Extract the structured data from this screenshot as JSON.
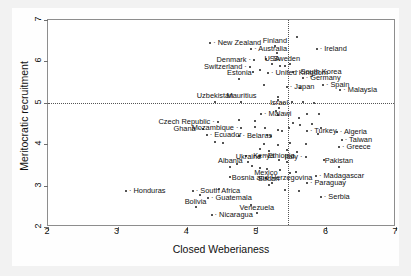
{
  "chart_data": {
    "type": "scatter",
    "title": "",
    "xlabel": "Closed Weberianess",
    "ylabel": "Meritocratic recruitment",
    "xlim": [
      2,
      7
    ],
    "ylim": [
      2,
      7
    ],
    "xticks": [
      2,
      3,
      4,
      5,
      6,
      7
    ],
    "yticks": [
      2,
      3,
      4,
      5,
      6,
      7
    ],
    "grid": false,
    "legend": null,
    "reference_lines": [
      {
        "orientation": "horizontal",
        "value": 5,
        "style": "dotted"
      },
      {
        "orientation": "vertical",
        "value": 5.45,
        "style": "dotted"
      }
    ],
    "points": [
      {
        "label": "New Zealand",
        "x": 4.33,
        "y": 6.44,
        "anchor": "left"
      },
      {
        "label": "Australia",
        "x": 4.92,
        "y": 6.3,
        "anchor": "left"
      },
      {
        "label": "Finland",
        "x": 5.26,
        "y": 6.36,
        "anchor": "center"
      },
      {
        "label": "Ireland",
        "x": 5.86,
        "y": 6.3,
        "anchor": "left"
      },
      {
        "label": "Denmark",
        "x": 4.96,
        "y": 6.03,
        "anchor": "right"
      },
      {
        "label": "Sweden",
        "x": 5.13,
        "y": 6.05,
        "anchor": "left"
      },
      {
        "label": "USA",
        "x": 5.22,
        "y": 5.93,
        "anchor": "center"
      },
      {
        "label": "Switzerland",
        "x": 4.9,
        "y": 5.86,
        "anchor": "right"
      },
      {
        "label": "United Kingdom",
        "x": 5.16,
        "y": 5.73,
        "anchor": "left"
      },
      {
        "label": "South Korea",
        "x": 5.52,
        "y": 5.74,
        "anchor": "left"
      },
      {
        "label": "Germany",
        "x": 5.66,
        "y": 5.6,
        "anchor": "left"
      },
      {
        "label": "Estonia",
        "x": 4.75,
        "y": 5.58,
        "anchor": "center"
      },
      {
        "label": "Japan",
        "x": 5.43,
        "y": 5.37,
        "anchor": "left"
      },
      {
        "label": "Spain",
        "x": 5.95,
        "y": 5.42,
        "anchor": "left"
      },
      {
        "label": "Malaysia",
        "x": 6.2,
        "y": 5.3,
        "anchor": "left"
      },
      {
        "label": "Uzbekistan",
        "x": 4.4,
        "y": 5.02,
        "anchor": "center"
      },
      {
        "label": "Mauritius",
        "x": 4.78,
        "y": 5.02,
        "anchor": "center"
      },
      {
        "label": "Israel",
        "x": 5.32,
        "y": 4.87,
        "anchor": "center"
      },
      {
        "label": "Malawi",
        "x": 5.06,
        "y": 4.72,
        "anchor": "left"
      },
      {
        "label": "Czech Republic",
        "x": 4.44,
        "y": 4.53,
        "anchor": "right"
      },
      {
        "label": "Turkey",
        "x": 5.72,
        "y": 4.33,
        "anchor": "left"
      },
      {
        "label": "Algeria",
        "x": 6.15,
        "y": 4.29,
        "anchor": "left"
      },
      {
        "label": "Mozambique",
        "x": 4.78,
        "y": 4.39,
        "anchor": "right"
      },
      {
        "label": "Ghana",
        "x": 4.23,
        "y": 4.37,
        "anchor": "right"
      },
      {
        "label": "Ecuador",
        "x": 4.28,
        "y": 4.22,
        "anchor": "left"
      },
      {
        "label": "Belarus",
        "x": 4.75,
        "y": 4.2,
        "anchor": "left"
      },
      {
        "label": "Taiwan",
        "x": 6.22,
        "y": 4.1,
        "anchor": "left"
      },
      {
        "label": "Greece",
        "x": 6.18,
        "y": 3.93,
        "anchor": "left"
      },
      {
        "label": "Italy",
        "x": 5.7,
        "y": 3.7,
        "anchor": "right"
      },
      {
        "label": "Kenya",
        "x": 4.84,
        "y": 3.72,
        "anchor": "left"
      },
      {
        "label": "Ethiopia",
        "x": 5.05,
        "y": 3.72,
        "anchor": "left"
      },
      {
        "label": "Ukraine",
        "x": 4.88,
        "y": 3.57,
        "anchor": "center"
      },
      {
        "label": "Albania",
        "x": 4.62,
        "y": 3.45,
        "anchor": "center"
      },
      {
        "label": "Pakistan",
        "x": 6.18,
        "y": 3.45,
        "anchor": "center"
      },
      {
        "label": "Mexico",
        "x": 5.13,
        "y": 3.18,
        "anchor": "center"
      },
      {
        "label": "Madagascar",
        "x": 5.85,
        "y": 3.23,
        "anchor": "left"
      },
      {
        "label": "Sudan",
        "x": 5.17,
        "y": 3.02,
        "anchor": "center"
      },
      {
        "label": "Bosnia and Herzegovina",
        "x": 5.22,
        "y": 3.06,
        "anchor": "center"
      },
      {
        "label": "Paraguay",
        "x": 5.72,
        "y": 3.06,
        "anchor": "left"
      },
      {
        "label": "Honduras",
        "x": 3.12,
        "y": 2.88,
        "anchor": "left"
      },
      {
        "label": "South Africa",
        "x": 4.08,
        "y": 2.88,
        "anchor": "left"
      },
      {
        "label": "Serbia",
        "x": 5.92,
        "y": 2.72,
        "anchor": "left"
      },
      {
        "label": "Guatemala",
        "x": 4.3,
        "y": 2.7,
        "anchor": "left"
      },
      {
        "label": "Bolivia",
        "x": 4.12,
        "y": 2.48,
        "anchor": "center"
      },
      {
        "label": "Venezuela",
        "x": 5.0,
        "y": 2.33,
        "anchor": "center"
      },
      {
        "label": "Nicaragua",
        "x": 4.35,
        "y": 2.28,
        "anchor": "left"
      }
    ],
    "unlabeled_points": [
      {
        "x": 5.58,
        "y": 6.58
      },
      {
        "x": 5.29,
        "y": 6.2
      },
      {
        "x": 5.4,
        "y": 5.9
      },
      {
        "x": 5.47,
        "y": 5.94
      },
      {
        "x": 5.34,
        "y": 5.88
      },
      {
        "x": 5.05,
        "y": 5.8
      },
      {
        "x": 4.95,
        "y": 5.74
      },
      {
        "x": 5.1,
        "y": 5.44
      },
      {
        "x": 5.62,
        "y": 5.36
      },
      {
        "x": 5.3,
        "y": 5.07
      },
      {
        "x": 5.3,
        "y": 5.13
      },
      {
        "x": 5.5,
        "y": 5.02
      },
      {
        "x": 5.66,
        "y": 5.02
      },
      {
        "x": 5.82,
        "y": 5.0
      },
      {
        "x": 5.28,
        "y": 4.8
      },
      {
        "x": 5.3,
        "y": 4.7
      },
      {
        "x": 5.72,
        "y": 4.72
      },
      {
        "x": 5.9,
        "y": 4.74
      },
      {
        "x": 5.6,
        "y": 4.64
      },
      {
        "x": 4.98,
        "y": 4.56
      },
      {
        "x": 4.75,
        "y": 4.58
      },
      {
        "x": 5.52,
        "y": 4.52
      },
      {
        "x": 5.62,
        "y": 4.46
      },
      {
        "x": 5.8,
        "y": 4.5
      },
      {
        "x": 5.46,
        "y": 4.4
      },
      {
        "x": 5.12,
        "y": 4.4
      },
      {
        "x": 5.3,
        "y": 4.35
      },
      {
        "x": 5.36,
        "y": 4.32
      },
      {
        "x": 5.92,
        "y": 4.4
      },
      {
        "x": 5.14,
        "y": 4.22
      },
      {
        "x": 5.2,
        "y": 4.2
      },
      {
        "x": 5.88,
        "y": 4.24
      },
      {
        "x": 4.4,
        "y": 4.06
      },
      {
        "x": 4.52,
        "y": 4.04
      },
      {
        "x": 5.1,
        "y": 4.0
      },
      {
        "x": 5.3,
        "y": 3.98
      },
      {
        "x": 5.48,
        "y": 4.02
      },
      {
        "x": 5.96,
        "y": 3.62
      },
      {
        "x": 5.44,
        "y": 3.86
      },
      {
        "x": 5.18,
        "y": 3.84
      },
      {
        "x": 5.05,
        "y": 3.88
      },
      {
        "x": 5.58,
        "y": 3.8
      },
      {
        "x": 5.32,
        "y": 3.62
      },
      {
        "x": 5.44,
        "y": 3.58
      },
      {
        "x": 4.72,
        "y": 3.52
      },
      {
        "x": 4.93,
        "y": 3.48
      },
      {
        "x": 5.04,
        "y": 3.42
      },
      {
        "x": 5.15,
        "y": 3.4
      },
      {
        "x": 5.33,
        "y": 3.38
      },
      {
        "x": 5.48,
        "y": 3.3
      },
      {
        "x": 5.57,
        "y": 3.34
      },
      {
        "x": 4.18,
        "y": 2.78
      },
      {
        "x": 4.45,
        "y": 2.92
      },
      {
        "x": 5.4,
        "y": 2.9
      },
      {
        "x": 4.92,
        "y": 2.54
      },
      {
        "x": 5.6,
        "y": 2.86
      },
      {
        "x": 4.62,
        "y": 3.2
      },
      {
        "x": 5.7,
        "y": 4.0
      },
      {
        "x": 4.98,
        "y": 4.42
      }
    ]
  },
  "axes": {
    "xlabel": "Closed Weberianess",
    "ylabel": "Meritocratic recruitment",
    "xtick_labels": [
      "2",
      "3",
      "4",
      "5",
      "6",
      "7"
    ],
    "ytick_labels": [
      "2",
      "3",
      "4",
      "5",
      "6",
      "7"
    ]
  },
  "colors": {
    "point": "#1b1b1b",
    "frame": "#8d8d8d",
    "refline": "#555555",
    "background": "#f2f2f2",
    "plot_background": "#ffffff"
  }
}
